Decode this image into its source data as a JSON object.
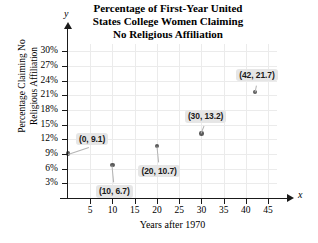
{
  "chart_data": {
    "type": "scatter",
    "title": "Percentage of First-Year United States College Women Claiming No Religious Affiliation",
    "title_lines": [
      "Percentage of First-Year United",
      "States College Women Claiming",
      "No Religious Affiliation"
    ],
    "xlabel": "Years after 1970",
    "ylabel": "Percentage Claiming No Religious Affiliation",
    "ylabel_lines": [
      "Percentage Claiming No",
      "Religious Affiliation"
    ],
    "x_axis_letter": "y",
    "y_axis_letter": "x",
    "axis_letters": {
      "vertical": "y",
      "horizontal": "x"
    },
    "xlim": [
      0,
      47
    ],
    "ylim": [
      0,
      31.5
    ],
    "xticks": [
      5,
      10,
      15,
      20,
      25,
      30,
      35,
      40,
      45
    ],
    "xtick_labels": [
      "5",
      "10",
      "15",
      "20",
      "25",
      "30",
      "35",
      "40",
      "45"
    ],
    "yticks": [
      3,
      6,
      9,
      12,
      15,
      18,
      21,
      24,
      27,
      30
    ],
    "ytick_labels": [
      "3%",
      "6%",
      "9%",
      "12%",
      "15%",
      "18%",
      "21%",
      "24%",
      "27%",
      "30%"
    ],
    "grid": true,
    "legend": false,
    "x": [
      0,
      10,
      20,
      30,
      42
    ],
    "values": [
      9.1,
      6.7,
      10.7,
      13.2,
      21.7
    ],
    "points": [
      {
        "x": 0,
        "y": 9.1,
        "label": "(0, 9.1)",
        "label_dx": 8,
        "label_dy": -21
      },
      {
        "x": 10,
        "y": 6.7,
        "label": "(10, 6.7)",
        "label_dx": -8,
        "label_dy": 20
      },
      {
        "x": 20,
        "y": 10.7,
        "label": "(20, 10.7)",
        "label_dx": -8,
        "label_dy": 19
      },
      {
        "x": 30,
        "y": 13.2,
        "label": "(30, 13.2)",
        "label_dx": -6,
        "label_dy": -23
      },
      {
        "x": 42,
        "y": 21.7,
        "label": "(42, 21.7)",
        "label_dx": -8,
        "label_dy": -23
      }
    ],
    "colors": {
      "marker": "#5a5a5a",
      "grid": "#ebebeb",
      "axis": "#1a1a1a",
      "callout_bg": "#e6e6e6",
      "callout_text": "#1a1a1a",
      "background": "#ffffff"
    }
  }
}
